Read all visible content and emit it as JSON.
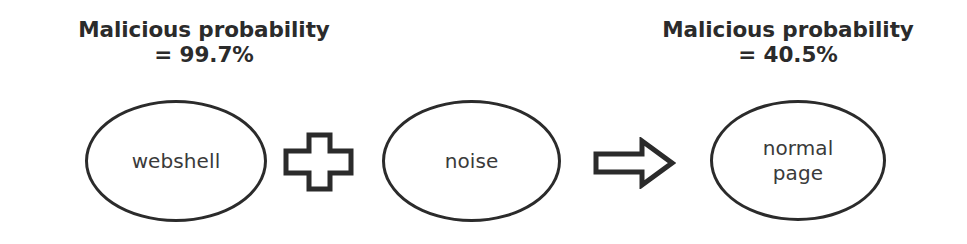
{
  "figure": {
    "background_color": "#ffffff",
    "ink_color": "#2b2b2b",
    "width": 967,
    "height": 244
  },
  "labels": {
    "left": {
      "title": "Malicious probability",
      "value": "= 99.7%"
    },
    "right": {
      "title": "Malicious probability",
      "value": "= 40.5%"
    }
  },
  "nodes": [
    {
      "id": "webshell",
      "text": "webshell"
    },
    {
      "id": "noise",
      "text": "noise"
    },
    {
      "id": "normal_page",
      "text": "normal\npage"
    }
  ],
  "operators": [
    {
      "id": "plus",
      "icon": "plus-icon",
      "symbol": "+"
    },
    {
      "id": "arrow",
      "icon": "right-arrow-icon",
      "symbol": "⇒"
    }
  ]
}
